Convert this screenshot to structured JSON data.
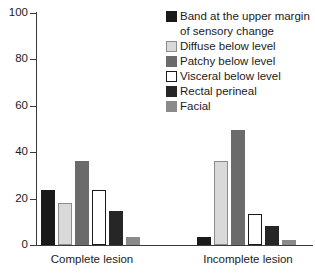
{
  "chart_data": {
    "type": "bar",
    "title": "",
    "subtitle": "",
    "xlabel": "",
    "ylabel": "",
    "ylim": [
      0,
      100
    ],
    "yticks": [
      0,
      20,
      40,
      60,
      80,
      100
    ],
    "ytick_labels": [
      "0",
      "20",
      "40",
      "60",
      "80",
      "100"
    ],
    "grid": false,
    "legend_position": "top-right",
    "categories": [
      "Complete lesion",
      "Incomplete lesion"
    ],
    "series": [
      {
        "name": "Band at the upper margin of sensory change",
        "color": "#1a1a1a",
        "border": "#1a1a1a",
        "values": [
          23.5,
          3.5
        ]
      },
      {
        "name": "Diffuse below level",
        "color": "#d9d9d9",
        "border": "#8c8c8c",
        "values": [
          18,
          36
        ]
      },
      {
        "name": "Patchy below level",
        "color": "#6b6b6b",
        "border": "#6b6b6b",
        "values": [
          36,
          49.5
        ]
      },
      {
        "name": "Visceral below level",
        "color": "#ffffff",
        "border": "#1a1a1a",
        "values": [
          23.5,
          13.5
        ]
      },
      {
        "name": "Rectal perineal",
        "color": "#262626",
        "border": "#262626",
        "values": [
          14.5,
          8
        ]
      },
      {
        "name": "Facial",
        "color": "#8a8a8a",
        "border": "#8a8a8a",
        "values": [
          3.5,
          2
        ]
      }
    ]
  },
  "legend": {
    "items": [
      {
        "label": "Band at the upper margin",
        "label_cont": "of sensory change"
      },
      {
        "label": "Diffuse below level"
      },
      {
        "label": "Patchy below level"
      },
      {
        "label": "Visceral below level"
      },
      {
        "label": "Rectal perineal"
      },
      {
        "label": "Facial"
      }
    ]
  },
  "axis": {
    "y_labels": [
      "100",
      "80",
      "60",
      "40",
      "20",
      "0"
    ],
    "x_labels": [
      "Complete lesion",
      "Incomplete lesion"
    ]
  },
  "colors": {
    "axis": "#3a3a3a",
    "text": "#1c1c1c",
    "background": "#ffffff"
  }
}
